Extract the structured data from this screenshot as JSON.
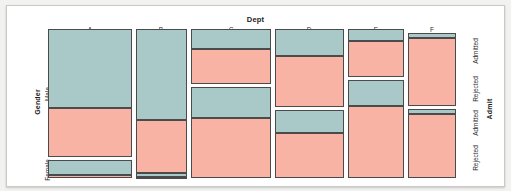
{
  "figure": {
    "top_axis_title": "Dept",
    "left_axis_title": "Gender",
    "right_axis_title": "Admit"
  },
  "axes": {
    "dept_ticks": [
      "A",
      "B",
      "C",
      "D",
      "E",
      "F"
    ],
    "gender_ticks": [
      "Male",
      "Female"
    ],
    "admit_ticks_male": [
      "Admitted",
      "Rejected"
    ],
    "admit_ticks_female": [
      "Admitted",
      "Rejected"
    ]
  },
  "colors": {
    "admitted": "#a9c8c8",
    "rejected": "#f9b3a4",
    "tile_border": "#4b4b4b",
    "panel_background": "#ffffff",
    "page_background": "#f2f2f0",
    "frame_border": "#c9c9c7"
  },
  "chart_data": {
    "type": "mosaic",
    "title": "Dept",
    "xlabel": "Dept",
    "ylabel": "Gender",
    "y2label": "Admit",
    "x_categories": [
      "A",
      "B",
      "C",
      "D",
      "E",
      "F"
    ],
    "y_categories": [
      "Male",
      "Female"
    ],
    "fill_categories": [
      "Admitted",
      "Rejected"
    ],
    "grid": false,
    "legend": "none",
    "note": "UCB Admissions style mosaic: column width proportional to department total; within each department the Male/Female split sets row heights and the Admitted/Rejected split sets tile heights.",
    "column_widths_fraction": [
      0.205,
      0.125,
      0.199,
      0.172,
      0.139,
      0.12
    ],
    "cells": [
      {
        "dept": "A",
        "gender": "Male",
        "admit": "Admitted",
        "height_fraction": 0.62
      },
      {
        "dept": "A",
        "gender": "Male",
        "admit": "Rejected",
        "height_fraction": 0.38
      },
      {
        "dept": "A",
        "gender": "Female",
        "admit": "Admitted",
        "height_fraction": 0.824
      },
      {
        "dept": "A",
        "gender": "Female",
        "admit": "Rejected",
        "height_fraction": 0.176
      },
      {
        "dept": "B",
        "gender": "Male",
        "admit": "Admitted",
        "height_fraction": 0.63
      },
      {
        "dept": "B",
        "gender": "Male",
        "admit": "Rejected",
        "height_fraction": 0.37
      },
      {
        "dept": "B",
        "gender": "Female",
        "admit": "Admitted",
        "height_fraction": 0.8
      },
      {
        "dept": "B",
        "gender": "Female",
        "admit": "Rejected",
        "height_fraction": 0.2
      },
      {
        "dept": "C",
        "gender": "Male",
        "admit": "Admitted",
        "height_fraction": 0.37
      },
      {
        "dept": "C",
        "gender": "Male",
        "admit": "Rejected",
        "height_fraction": 0.63
      },
      {
        "dept": "C",
        "gender": "Female",
        "admit": "Admitted",
        "height_fraction": 0.34
      },
      {
        "dept": "C",
        "gender": "Female",
        "admit": "Rejected",
        "height_fraction": 0.66
      },
      {
        "dept": "D",
        "gender": "Male",
        "admit": "Admitted",
        "height_fraction": 0.34
      },
      {
        "dept": "D",
        "gender": "Male",
        "admit": "Rejected",
        "height_fraction": 0.66
      },
      {
        "dept": "D",
        "gender": "Female",
        "admit": "Admitted",
        "height_fraction": 0.34
      },
      {
        "dept": "D",
        "gender": "Female",
        "admit": "Rejected",
        "height_fraction": 0.66
      },
      {
        "dept": "E",
        "gender": "Male",
        "admit": "Admitted",
        "height_fraction": 0.25
      },
      {
        "dept": "E",
        "gender": "Male",
        "admit": "Rejected",
        "height_fraction": 0.75
      },
      {
        "dept": "E",
        "gender": "Female",
        "admit": "Admitted",
        "height_fraction": 0.27
      },
      {
        "dept": "E",
        "gender": "Female",
        "admit": "Rejected",
        "height_fraction": 0.73
      },
      {
        "dept": "F",
        "gender": "Male",
        "admit": "Admitted",
        "height_fraction": 0.065
      },
      {
        "dept": "F",
        "gender": "Male",
        "admit": "Rejected",
        "height_fraction": 0.935
      },
      {
        "dept": "F",
        "gender": "Female",
        "admit": "Admitted",
        "height_fraction": 0.07
      },
      {
        "dept": "F",
        "gender": "Female",
        "admit": "Rejected",
        "height_fraction": 0.93
      }
    ],
    "layout_px": {
      "plot_left": 47,
      "plot_right": 455,
      "plot_top": 28,
      "plot_bottom": 177,
      "col_gap": 4,
      "row_gap": 3,
      "columns": [
        {
          "dept": "A",
          "x": 47,
          "w": 84,
          "male_top": 28,
          "male_h": 128,
          "female_top": 159,
          "female_h": 18
        },
        {
          "dept": "B",
          "x": 135,
          "w": 51,
          "male_top": 28,
          "male_h": 144,
          "female_top": 172,
          "female_h": 5
        },
        {
          "dept": "C",
          "x": 190,
          "w": 80,
          "male_top": 28,
          "male_h": 55,
          "female_top": 86,
          "female_h": 91
        },
        {
          "dept": "D",
          "x": 274,
          "w": 69,
          "male_top": 28,
          "male_h": 78,
          "female_top": 109,
          "female_h": 68
        },
        {
          "dept": "E",
          "x": 347,
          "w": 56,
          "male_top": 28,
          "male_h": 48,
          "female_top": 79,
          "female_h": 98
        },
        {
          "dept": "F",
          "x": 407,
          "w": 48,
          "male_top": 32,
          "male_h": 73,
          "female_top": 108,
          "female_h": 69
        }
      ]
    }
  }
}
